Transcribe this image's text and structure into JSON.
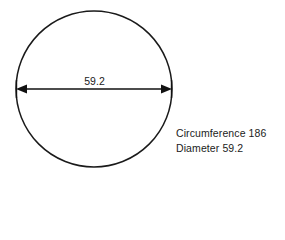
{
  "figure": {
    "background_color": "#ffffff",
    "ink_color": "#1a1a1a",
    "shape": {
      "name": "circle",
      "center_x": 94,
      "center_y": 89,
      "radius": 78,
      "stroke_width": 1.5
    },
    "dimension": {
      "label": "59.2",
      "orientation": "horizontal",
      "start_x": 16,
      "end_x": 172,
      "y": 89,
      "arrow_style": "double-headed"
    }
  },
  "annotations": {
    "lines": [
      "Circumference 186",
      "Diameter 59.2"
    ],
    "circumference_label": "Circumference 186",
    "diameter_label": "Diameter 59.2"
  },
  "chart_data": {
    "type": "diagram",
    "shape": "circle",
    "title": "",
    "measurements": [
      {
        "name": "Diameter",
        "value": 59.2,
        "display": "59.2"
      },
      {
        "name": "Circumference",
        "value": 186,
        "display": "186"
      }
    ],
    "annotations": [
      "Circumference 186",
      "Diameter 59.2"
    ],
    "inline_dimension_label": "59.2"
  }
}
